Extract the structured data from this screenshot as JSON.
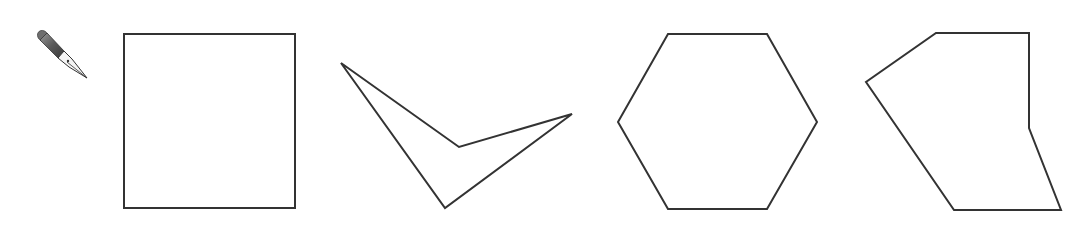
{
  "tool": {
    "name": "pen-tool",
    "icon": "fountain-pen-nib-icon",
    "label": "Pen tool"
  },
  "style": {
    "stroke_color": "#333333",
    "background": "#ffffff"
  },
  "shapes": [
    {
      "id": "square",
      "label": "Square",
      "kind": "rectangle",
      "sides": 4
    },
    {
      "id": "concave-quadrilateral",
      "label": "Concave quadrilateral",
      "kind": "polygon",
      "sides": 4
    },
    {
      "id": "hexagon",
      "label": "Regular hexagon",
      "kind": "polygon",
      "sides": 6
    },
    {
      "id": "irregular-hexagon",
      "label": "Irregular hexagon",
      "kind": "polygon",
      "sides": 6
    }
  ]
}
